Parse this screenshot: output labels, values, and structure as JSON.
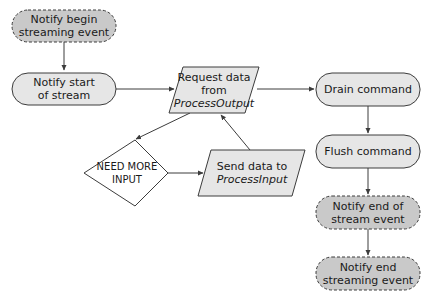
{
  "diagram": {
    "type": "flowchart",
    "colors": {
      "event_fill": "#c9c9c9",
      "process_fill": "#e6e6e6",
      "stroke": "#3c3c3c",
      "decision_fill": "#ffffff"
    },
    "nodes": {
      "begin_streaming": {
        "line1": "Notify begin",
        "line2": "streaming event",
        "shape": "rounded-dashed"
      },
      "start_of_stream": {
        "line1": "Notify start",
        "line2": "of stream",
        "shape": "rounded"
      },
      "request_data": {
        "line1": "Request data",
        "line2": "from",
        "line3": "ProcessOutput",
        "shape": "parallelogram"
      },
      "need_more_input": {
        "line1": "NEED MORE INPUT",
        "shape": "diamond"
      },
      "send_data": {
        "line1": "Send data to",
        "line2": "ProcessInput",
        "shape": "parallelogram"
      },
      "drain": {
        "line1": "Drain command",
        "shape": "rounded"
      },
      "flush": {
        "line1": "Flush command",
        "shape": "rounded"
      },
      "end_of_stream": {
        "line1": "Notify end of",
        "line2": "stream event",
        "shape": "rounded-dashed"
      },
      "end_streaming": {
        "line1": "Notify end",
        "line2": "streaming event",
        "shape": "rounded-dashed"
      }
    },
    "edges": [
      {
        "from": "Notify begin streaming event",
        "to": "Notify start of stream"
      },
      {
        "from": "Notify start of stream",
        "to": "Request data from ProcessOutput"
      },
      {
        "from": "Request data from ProcessOutput",
        "to": "NEED MORE INPUT"
      },
      {
        "from": "NEED MORE INPUT",
        "to": "Send data to ProcessInput"
      },
      {
        "from": "Send data to ProcessInput",
        "to": "Request data from ProcessOutput"
      },
      {
        "from": "Request data from ProcessOutput",
        "to": "Drain command"
      },
      {
        "from": "Drain command",
        "to": "Flush command"
      },
      {
        "from": "Flush command",
        "to": "Notify end of stream event"
      },
      {
        "from": "Notify end of stream event",
        "to": "Notify end streaming event"
      }
    ]
  }
}
